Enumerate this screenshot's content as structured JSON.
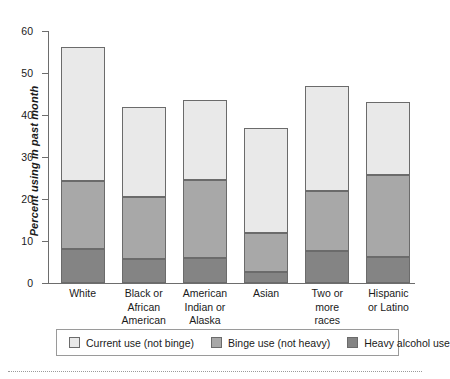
{
  "chart_data": {
    "type": "bar",
    "subtype": "stacked-vertical",
    "title": "",
    "xlabel": "",
    "ylabel": "Percent using in past month",
    "ylim": [
      0,
      60
    ],
    "yticks": [
      0,
      10,
      20,
      30,
      40,
      50,
      60
    ],
    "grid": false,
    "legend_position": "bottom",
    "categories": [
      "White",
      "Black or\nAfrican\nAmerican",
      "American\nIndian or\nAlaska native",
      "Asian",
      "Two or\nmore\nraces",
      "Hispanic\nor Latino"
    ],
    "series": [
      {
        "name": "Heavy alcohol use",
        "color": "#848484",
        "values": [
          8.0,
          5.7,
          6.0,
          2.6,
          7.6,
          6.2
        ]
      },
      {
        "name": "Binge use (not heavy)",
        "color": "#a8a8a8",
        "values": [
          16.3,
          14.8,
          18.5,
          9.4,
          14.4,
          19.5
        ]
      },
      {
        "name": "Current use (not binge)",
        "color": "#e9e9e9",
        "values": [
          32.0,
          21.5,
          19.0,
          25.0,
          25.0,
          17.3
        ]
      }
    ],
    "cumulative_tops": [
      {
        "category": "White",
        "heavy": 8.0,
        "binge_top": 24.3,
        "total": 56.3
      },
      {
        "category": "Black or African American",
        "heavy": 5.7,
        "binge_top": 20.5,
        "total": 42.0
      },
      {
        "category": "American Indian or Alaska native",
        "heavy": 6.0,
        "binge_top": 24.5,
        "total": 43.5
      },
      {
        "category": "Asian",
        "heavy": 2.6,
        "binge_top": 12.0,
        "total": 37.0
      },
      {
        "category": "Two or more races",
        "heavy": 7.6,
        "binge_top": 22.0,
        "total": 47.0
      },
      {
        "category": "Hispanic or Latino",
        "heavy": 6.2,
        "binge_top": 25.7,
        "total": 43.0
      }
    ]
  },
  "axis": {
    "y_label": "Percent using in past month",
    "y_ticks": [
      "0",
      "10",
      "20",
      "30",
      "40",
      "50",
      "60"
    ]
  },
  "legend": {
    "items": [
      {
        "label": "Current use (not binge)",
        "color": "#e9e9e9"
      },
      {
        "label": "Binge use (not heavy)",
        "color": "#a8a8a8"
      },
      {
        "label": "Heavy alcohol use",
        "color": "#848484"
      }
    ]
  },
  "colors": {
    "current_use": "#e9e9e9",
    "binge_use": "#a8a8a8",
    "heavy_use": "#848484",
    "axis": "#6d6d6d",
    "bar_outline": "#6b6b6b",
    "legend_border": "#9a9a9a",
    "background": "#ffffff"
  }
}
